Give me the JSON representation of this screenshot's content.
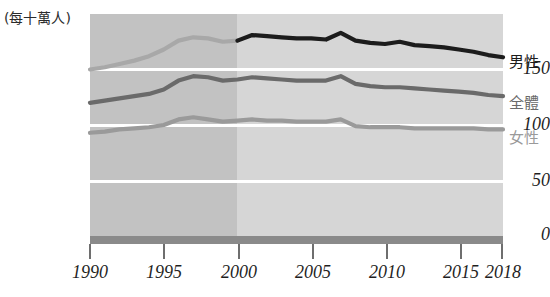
{
  "chart": {
    "unit_title": "(每十萬人)",
    "y_axis": {
      "ticks": [
        "150",
        "100",
        "50",
        "0"
      ],
      "tick_values": [
        150,
        100,
        50,
        0
      ],
      "range": [
        0,
        200
      ]
    },
    "x_axis": {
      "ticks": [
        "1990",
        "1995",
        "2000",
        "2005",
        "2010",
        "2015",
        "2018"
      ],
      "tick_values": [
        1990,
        1995,
        2000,
        2005,
        2010,
        2015,
        2018
      ],
      "range": [
        1990,
        2018
      ]
    },
    "legend": [
      {
        "label": "男性",
        "color": "#1c1c1c"
      },
      {
        "label": "全體",
        "color": "#6a6a6a"
      },
      {
        "label": "女性",
        "color": "#9a9a9a"
      }
    ],
    "bands": {
      "early_label": "1990-2000",
      "early_color": "#c2c2c2",
      "late_label": "2000-2018",
      "late_color": "#d6d6d6",
      "split_year": 2000
    },
    "baseline_color": "#8a8a8a",
    "gridline_color": "#ffffff"
  },
  "chart_data": {
    "type": "line",
    "title": "",
    "subtitle": "",
    "xlabel": "",
    "ylabel": "(每十萬人)",
    "xlim": [
      1990,
      2018
    ],
    "ylim": [
      0,
      200
    ],
    "grid": true,
    "legend_position": "right",
    "x": [
      1990,
      1991,
      1992,
      1993,
      1994,
      1995,
      1996,
      1997,
      1998,
      1999,
      2000,
      2001,
      2002,
      2003,
      2004,
      2005,
      2006,
      2007,
      2008,
      2009,
      2010,
      2011,
      2012,
      2013,
      2014,
      2015,
      2016,
      2017,
      2018
    ],
    "series": [
      {
        "name": "男性",
        "color": "#1c1c1c",
        "note": "drawn from 2000 onward as a dark line; pre-2000 segment rendered in light grey",
        "values": [
          150,
          152,
          155,
          158,
          162,
          168,
          176,
          179,
          178,
          175,
          176,
          181,
          180,
          179,
          178,
          178,
          177,
          183,
          176,
          174,
          173,
          175,
          172,
          171,
          170,
          168,
          166,
          163,
          161
        ]
      },
      {
        "name": "全體",
        "color": "#6a6a6a",
        "values": [
          120,
          122,
          124,
          126,
          128,
          132,
          140,
          144,
          143,
          140,
          141,
          143,
          142,
          141,
          140,
          140,
          140,
          144,
          137,
          135,
          134,
          134,
          133,
          132,
          131,
          130,
          129,
          127,
          126
        ]
      },
      {
        "name": "女性",
        "color": "#9a9a9a",
        "values": [
          93,
          94,
          96,
          97,
          98,
          100,
          105,
          107,
          105,
          103,
          104,
          105,
          104,
          104,
          103,
          103,
          103,
          105,
          99,
          98,
          98,
          98,
          97,
          97,
          97,
          97,
          97,
          96,
          96
        ]
      }
    ]
  }
}
